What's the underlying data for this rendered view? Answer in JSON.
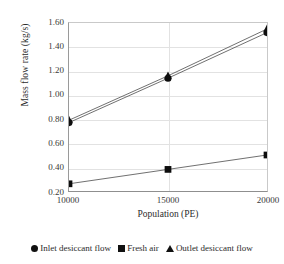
{
  "chart_data": {
    "type": "line",
    "title": "",
    "xlabel": "Population (PE)",
    "ylabel": "Mass flow rate (kg/s)",
    "x": [
      10000,
      15000,
      20000
    ],
    "categories": [
      "10000",
      "15000",
      "20000"
    ],
    "xtick_labels": [
      "10000",
      "15000",
      "20000"
    ],
    "ytick_labels": [
      "0.20",
      "0.40",
      "0.60",
      "0.80",
      "1.00",
      "1.20",
      "1.40",
      "1.60"
    ],
    "ytick_values": [
      0.2,
      0.4,
      0.6,
      0.8,
      1.0,
      1.2,
      1.4,
      1.6
    ],
    "xlim": [
      10000,
      20000
    ],
    "ylim": [
      0.2,
      1.6
    ],
    "grid": true,
    "legend_position": "bottom",
    "series": [
      {
        "name": "Inlet desiccant flow",
        "marker": "circle",
        "color": "#0d0d0d",
        "values": [
          0.77,
          1.14,
          1.52
        ]
      },
      {
        "name": "Fresh air",
        "marker": "square",
        "color": "#0d0d0d",
        "values": [
          0.26,
          0.38,
          0.5
        ]
      },
      {
        "name": "Outlet desiccant flow",
        "marker": "triangle",
        "color": "#0d0d0d",
        "values": [
          0.79,
          1.16,
          1.55
        ]
      }
    ]
  },
  "axes": {
    "y_title": "Mass flow rate (kg/s)",
    "x_title": "Population (PE)",
    "y_ticks": [
      {
        "label": "1.60"
      },
      {
        "label": "1.40"
      },
      {
        "label": "1.20"
      },
      {
        "label": "1.00"
      },
      {
        "label": "0.80"
      },
      {
        "label": "0.60"
      },
      {
        "label": "0.40"
      },
      {
        "label": "0.20"
      }
    ],
    "x_ticks": [
      {
        "label": "10000"
      },
      {
        "label": "15000"
      },
      {
        "label": "20000"
      }
    ]
  },
  "legend": {
    "items": [
      {
        "label": "Inlet desiccant flow",
        "marker": "circle"
      },
      {
        "label": "Fresh air",
        "marker": "square"
      },
      {
        "label": "Outlet desiccant flow",
        "marker": "triangle"
      }
    ]
  },
  "colors": {
    "series": "#0d0d0d",
    "line": "#4a4a4a",
    "grid": "#e2e2e2",
    "axis": "#8f8f8f",
    "text": "#2b2b2b",
    "background": "#ffffff"
  }
}
